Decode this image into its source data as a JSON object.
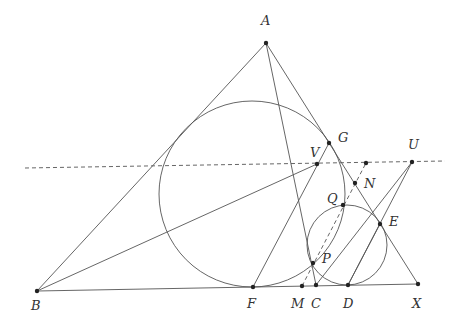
{
  "diagram": {
    "stroke": "#555555",
    "points": [
      {
        "name": "A",
        "x": 266,
        "y": 43,
        "lx": 261,
        "ly": 14
      },
      {
        "name": "B",
        "x": 37,
        "y": 291,
        "lx": 31,
        "ly": 299
      },
      {
        "name": "F",
        "x": 253,
        "y": 287,
        "lx": 247,
        "ly": 297
      },
      {
        "name": "M",
        "x": 302,
        "y": 286,
        "lx": 291,
        "ly": 297
      },
      {
        "name": "C",
        "x": 316,
        "y": 285,
        "lx": 311,
        "ly": 297
      },
      {
        "name": "D",
        "x": 348,
        "y": 285,
        "lx": 343,
        "ly": 297
      },
      {
        "name": "X",
        "x": 418,
        "y": 284,
        "lx": 412,
        "ly": 297
      },
      {
        "name": "G",
        "x": 329,
        "y": 143,
        "lx": 338,
        "ly": 131
      },
      {
        "name": "V",
        "x": 317,
        "y": 164,
        "lx": 310,
        "ly": 146
      },
      {
        "name": "U",
        "x": 412,
        "y": 162,
        "lx": 408,
        "ly": 138
      },
      {
        "name": "N",
        "x": 355,
        "y": 183,
        "lx": 364,
        "ly": 177
      },
      {
        "name": "Q",
        "x": 343,
        "y": 205,
        "lx": 327,
        "ly": 192
      },
      {
        "name": "E",
        "x": 380,
        "y": 224,
        "lx": 389,
        "ly": 215
      },
      {
        "name": "P",
        "x": 313,
        "y": 263,
        "lx": 322,
        "ly": 252
      },
      {
        "name": "",
        "x": 366,
        "y": 163,
        "lx": 0,
        "ly": 0
      }
    ],
    "segments": [
      [
        "A",
        "B"
      ],
      [
        "A",
        "X"
      ],
      [
        "B",
        "X"
      ],
      [
        "A",
        "C"
      ],
      [
        "B",
        "V"
      ],
      [
        "F",
        "G"
      ],
      [
        "C",
        "U"
      ],
      [
        "D",
        "U"
      ],
      [
        "D",
        "E"
      ]
    ],
    "dashed": [
      {
        "x1": 25,
        "y1": 168,
        "x2": 445,
        "y2": 161
      },
      {
        "x1": 302,
        "y1": 286,
        "x2": 366,
        "y2": 163
      }
    ],
    "circles": [
      {
        "cx": 252,
        "cy": 194,
        "r": 93
      },
      {
        "cx": 347,
        "cy": 245,
        "r": 40
      }
    ]
  }
}
